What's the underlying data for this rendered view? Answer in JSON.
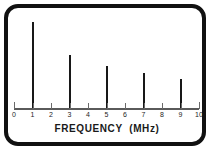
{
  "figure": {
    "frame_style": "rounded-black-border",
    "background_color": "#ffffff",
    "border_color": "#111111",
    "line_color": "#181818",
    "axis_color": "#5a5a5a"
  },
  "chart_data": {
    "type": "bar",
    "title": "",
    "subtitle": "",
    "xlabel": "FREQUENCY  (MHz)",
    "ylabel": "",
    "xlim": [
      0,
      10
    ],
    "ylim": [
      0,
      100
    ],
    "grid": false,
    "legend": null,
    "x_tick_labels": [
      "0",
      "1",
      "2",
      "3",
      "4",
      "5",
      "6",
      "7",
      "8",
      "9",
      "10"
    ],
    "x_ticks": [
      0,
      1,
      2,
      3,
      4,
      5,
      6,
      7,
      8,
      9,
      10
    ],
    "y_tick_labels": [],
    "categories": [
      1,
      3,
      5,
      7,
      9
    ],
    "values": [
      100,
      62,
      49,
      41,
      34
    ],
    "series": [
      {
        "name": "harmonic amplitude",
        "points": [
          {
            "x": 1,
            "y": 100
          },
          {
            "x": 3,
            "y": 62
          },
          {
            "x": 5,
            "y": 49
          },
          {
            "x": 7,
            "y": 41
          },
          {
            "x": 9,
            "y": 34
          }
        ]
      }
    ],
    "annotations": []
  },
  "axis": {
    "title": "FREQUENCY  (MHz)"
  }
}
